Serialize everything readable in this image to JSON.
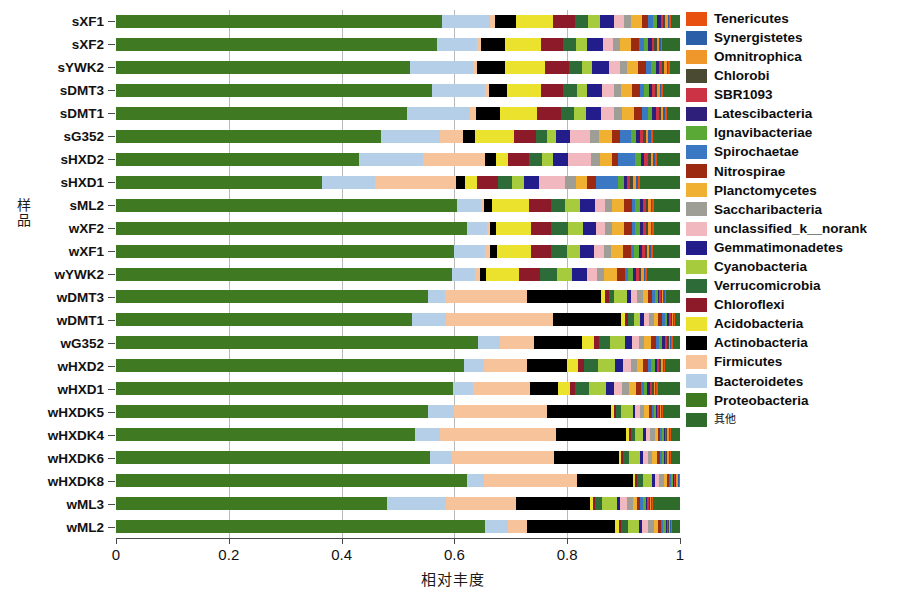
{
  "axes": {
    "y_title": "样品",
    "x_title": "相对丰度",
    "x_ticks": [
      "0",
      "0.2",
      "0.4",
      "0.6",
      "0.8",
      "1"
    ],
    "x_tick_values": [
      0,
      0.2,
      0.4,
      0.6,
      0.8,
      1
    ]
  },
  "legend": {
    "items": [
      {
        "label": "Tenericutes",
        "color": "#e8500f"
      },
      {
        "label": "Synergistetes",
        "color": "#2b5fa8"
      },
      {
        "label": "Omnitrophica",
        "color": "#f0972c"
      },
      {
        "label": "Chlorobi",
        "color": "#4a4a32"
      },
      {
        "label": "SBR1093",
        "color": "#cc3344"
      },
      {
        "label": "Latescibacteria",
        "color": "#2e1f7a"
      },
      {
        "label": "Ignavibacteriae",
        "color": "#5aa836"
      },
      {
        "label": "Spirochaetae",
        "color": "#3a78c4"
      },
      {
        "label": "Nitrospirae",
        "color": "#9c2a10"
      },
      {
        "label": "Planctomycetes",
        "color": "#f0b032"
      },
      {
        "label": "Saccharibacteria",
        "color": "#9e9e96"
      },
      {
        "label": "unclassified_k__norank",
        "color": "#f2b8c0"
      },
      {
        "label": "Gemmatimonadetes",
        "color": "#231d8c"
      },
      {
        "label": "Cyanobacteria",
        "color": "#a6cc3d"
      },
      {
        "label": "Verrucomicrobia",
        "color": "#2d6b38"
      },
      {
        "label": "Chloroflexi",
        "color": "#8c1a28"
      },
      {
        "label": "Acidobacteria",
        "color": "#ebe22e"
      },
      {
        "label": "Actinobacteria",
        "color": "#000000"
      },
      {
        "label": "Firmicutes",
        "color": "#f7c39b"
      },
      {
        "label": "Bacteroidetes",
        "color": "#b6cfe8"
      },
      {
        "label": "Proteobacteria",
        "color": "#3f7a22"
      },
      {
        "label": "其他",
        "color": "#2f6b2b",
        "cjk": true
      }
    ]
  },
  "chart_data": {
    "type": "bar",
    "orientation": "horizontal",
    "stacked": true,
    "normalized": true,
    "title": "",
    "xlabel": "相对丰度",
    "ylabel": "样品",
    "xlim": [
      0,
      1
    ],
    "grid": true,
    "legend_position": "right",
    "categories": [
      "sXF1",
      "sXF2",
      "sYWK2",
      "sDMT3",
      "sDMT1",
      "sG352",
      "sHXD2",
      "sHXD1",
      "sML2",
      "wXF2",
      "wXF1",
      "wYWK2",
      "wDMT3",
      "wDMT1",
      "wG352",
      "wHXD2",
      "wHXD1",
      "wHXDK5",
      "wHXDK4",
      "wHXDK6",
      "wHXDK8",
      "wML3",
      "wML2"
    ],
    "taxa_order": [
      "Proteobacteria",
      "Bacteroidetes",
      "Firmicutes",
      "Actinobacteria",
      "Acidobacteria",
      "Chloroflexi",
      "Verrucomicrobia",
      "Cyanobacteria",
      "Gemmatimonadetes",
      "unclassified_k__norank",
      "Saccharibacteria",
      "Planctomycetes",
      "Nitrospirae",
      "Spirochaetae",
      "Ignavibacteriae",
      "Latescibacteria",
      "SBR1093",
      "Chlorobi",
      "Omnitrophica",
      "Synergistetes",
      "Tenericutes",
      "其他"
    ],
    "series": [
      {
        "name": "Proteobacteria",
        "values": [
          0.59,
          0.57,
          0.51,
          0.56,
          0.505,
          0.47,
          0.43,
          0.355,
          0.605,
          0.625,
          0.6,
          0.585,
          0.55,
          0.525,
          0.64,
          0.61,
          0.59,
          0.555,
          0.53,
          0.555,
          0.625,
          0.48,
          0.65
        ]
      },
      {
        "name": "Bacteroidetes",
        "values": [
          0.087,
          0.07,
          0.11,
          0.095,
          0.11,
          0.105,
          0.115,
          0.09,
          0.042,
          0.035,
          0.055,
          0.04,
          0.03,
          0.06,
          0.04,
          0.035,
          0.035,
          0.045,
          0.045,
          0.04,
          0.03,
          0.105,
          0.04
        ]
      },
      {
        "name": "Firmicutes",
        "values": [
          0.008,
          0.008,
          0.008,
          0.006,
          0.01,
          0.04,
          0.11,
          0.14,
          0.006,
          0.006,
          0.008,
          0.01,
          0.145,
          0.19,
          0.06,
          0.075,
          0.1,
          0.165,
          0.205,
          0.18,
          0.165,
          0.125,
          0.035
        ]
      },
      {
        "name": "Actinobacteria",
        "values": [
          0.038,
          0.042,
          0.048,
          0.032,
          0.042,
          0.022,
          0.018,
          0.016,
          0.014,
          0.01,
          0.012,
          0.01,
          0.13,
          0.12,
          0.085,
          0.07,
          0.05,
          0.115,
          0.125,
          0.115,
          0.1,
          0.13,
          0.155
        ]
      },
      {
        "name": "Acidobacteria",
        "values": [
          0.068,
          0.064,
          0.07,
          0.06,
          0.065,
          0.068,
          0.022,
          0.02,
          0.066,
          0.062,
          0.06,
          0.058,
          0.008,
          0.008,
          0.02,
          0.02,
          0.02,
          0.004,
          0.004,
          0.004,
          0.004,
          0.006,
          0.006
        ]
      },
      {
        "name": "Chloroflexi",
        "values": [
          0.04,
          0.038,
          0.042,
          0.04,
          0.042,
          0.04,
          0.038,
          0.036,
          0.038,
          0.036,
          0.036,
          0.036,
          0.006,
          0.005,
          0.01,
          0.01,
          0.01,
          0.004,
          0.004,
          0.004,
          0.004,
          0.004,
          0.004
        ]
      },
      {
        "name": "Verrucomicrobia",
        "values": [
          0.022,
          0.024,
          0.022,
          0.024,
          0.022,
          0.02,
          0.022,
          0.024,
          0.026,
          0.03,
          0.028,
          0.03,
          0.01,
          0.01,
          0.02,
          0.024,
          0.024,
          0.01,
          0.008,
          0.01,
          0.01,
          0.012,
          0.012
        ]
      },
      {
        "name": "Cyanobacteria",
        "values": [
          0.022,
          0.02,
          0.018,
          0.018,
          0.02,
          0.016,
          0.02,
          0.02,
          0.026,
          0.026,
          0.024,
          0.026,
          0.022,
          0.012,
          0.026,
          0.03,
          0.03,
          0.02,
          0.014,
          0.02,
          0.016,
          0.026,
          0.02
        ]
      },
      {
        "name": "Gemmatimonadetes",
        "values": [
          0.026,
          0.028,
          0.028,
          0.026,
          0.026,
          0.024,
          0.026,
          0.026,
          0.026,
          0.024,
          0.024,
          0.026,
          0.008,
          0.006,
          0.012,
          0.014,
          0.014,
          0.005,
          0.004,
          0.005,
          0.005,
          0.006,
          0.006
        ]
      },
      {
        "name": "unclassified_k__norank",
        "values": [
          0.018,
          0.018,
          0.02,
          0.022,
          0.024,
          0.036,
          0.042,
          0.046,
          0.018,
          0.016,
          0.018,
          0.018,
          0.01,
          0.01,
          0.012,
          0.014,
          0.014,
          0.008,
          0.008,
          0.008,
          0.008,
          0.012,
          0.01
        ]
      },
      {
        "name": "Saccharibacteria",
        "values": [
          0.012,
          0.012,
          0.012,
          0.012,
          0.014,
          0.016,
          0.016,
          0.018,
          0.012,
          0.012,
          0.012,
          0.012,
          0.01,
          0.008,
          0.01,
          0.01,
          0.012,
          0.008,
          0.008,
          0.008,
          0.008,
          0.01,
          0.01
        ]
      },
      {
        "name": "Planctomycetes",
        "values": [
          0.02,
          0.02,
          0.02,
          0.02,
          0.02,
          0.022,
          0.02,
          0.02,
          0.022,
          0.022,
          0.022,
          0.022,
          0.01,
          0.008,
          0.012,
          0.012,
          0.012,
          0.008,
          0.006,
          0.008,
          0.006,
          0.008,
          0.008
        ]
      },
      {
        "name": "Nitrospirae",
        "values": [
          0.012,
          0.014,
          0.014,
          0.014,
          0.014,
          0.014,
          0.012,
          0.014,
          0.014,
          0.014,
          0.014,
          0.014,
          0.006,
          0.006,
          0.008,
          0.008,
          0.008,
          0.005,
          0.004,
          0.005,
          0.004,
          0.005,
          0.005
        ]
      },
      {
        "name": "Spirochaetae",
        "values": [
          0.008,
          0.008,
          0.008,
          0.008,
          0.01,
          0.02,
          0.03,
          0.038,
          0.006,
          0.006,
          0.006,
          0.006,
          0.006,
          0.006,
          0.006,
          0.006,
          0.006,
          0.004,
          0.004,
          0.004,
          0.004,
          0.006,
          0.004
        ]
      },
      {
        "name": "Ignavibacteriae",
        "values": [
          0.008,
          0.008,
          0.008,
          0.008,
          0.008,
          0.01,
          0.01,
          0.01,
          0.008,
          0.008,
          0.008,
          0.008,
          0.005,
          0.004,
          0.006,
          0.006,
          0.006,
          0.004,
          0.003,
          0.004,
          0.003,
          0.004,
          0.004
        ]
      },
      {
        "name": "Latescibacteria",
        "values": [
          0.006,
          0.006,
          0.006,
          0.006,
          0.006,
          0.006,
          0.006,
          0.006,
          0.006,
          0.006,
          0.006,
          0.006,
          0.003,
          0.003,
          0.004,
          0.004,
          0.004,
          0.002,
          0.002,
          0.002,
          0.002,
          0.003,
          0.002
        ]
      },
      {
        "name": "SBR1093",
        "values": [
          0.005,
          0.005,
          0.005,
          0.005,
          0.005,
          0.006,
          0.006,
          0.006,
          0.005,
          0.005,
          0.005,
          0.005,
          0.003,
          0.003,
          0.004,
          0.004,
          0.004,
          0.002,
          0.002,
          0.002,
          0.002,
          0.003,
          0.002
        ]
      },
      {
        "name": "Chlorobi",
        "values": [
          0.004,
          0.004,
          0.004,
          0.004,
          0.004,
          0.005,
          0.005,
          0.005,
          0.004,
          0.004,
          0.004,
          0.004,
          0.002,
          0.002,
          0.003,
          0.003,
          0.003,
          0.002,
          0.002,
          0.002,
          0.002,
          0.002,
          0.002
        ]
      },
      {
        "name": "Omnitrophica",
        "values": [
          0.004,
          0.004,
          0.004,
          0.004,
          0.004,
          0.004,
          0.004,
          0.004,
          0.004,
          0.004,
          0.004,
          0.004,
          0.002,
          0.002,
          0.003,
          0.003,
          0.003,
          0.002,
          0.002,
          0.002,
          0.002,
          0.002,
          0.002
        ]
      },
      {
        "name": "Synergistetes",
        "values": [
          0.003,
          0.003,
          0.003,
          0.003,
          0.003,
          0.004,
          0.004,
          0.004,
          0.003,
          0.003,
          0.003,
          0.003,
          0.002,
          0.002,
          0.002,
          0.002,
          0.002,
          0.002,
          0.002,
          0.002,
          0.002,
          0.002,
          0.002
        ]
      },
      {
        "name": "Tenericutes",
        "values": [
          0.003,
          0.003,
          0.003,
          0.003,
          0.003,
          0.004,
          0.004,
          0.004,
          0.003,
          0.003,
          0.003,
          0.003,
          0.002,
          0.002,
          0.002,
          0.002,
          0.002,
          0.002,
          0.002,
          0.002,
          0.002,
          0.002,
          0.002
        ]
      },
      {
        "name": "其他",
        "values": [
          0.016,
          0.031,
          0.017,
          0.03,
          0.023,
          0.048,
          0.04,
          0.068,
          0.046,
          0.046,
          0.048,
          0.057,
          0.025,
          0.008,
          0.013,
          0.026,
          0.039,
          0.03,
          0.016,
          0.016,
          0.0,
          0.047,
          0.013
        ]
      }
    ]
  }
}
